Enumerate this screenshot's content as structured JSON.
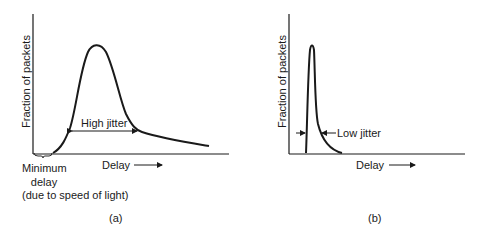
{
  "panels": [
    {
      "id": "a",
      "caption": "(a)",
      "y_axis_label": "Fraction of packets",
      "x_axis_label": "Delay",
      "annotation": "High jitter",
      "min_delay_label": [
        "Minimum",
        "delay",
        "(due to speed of light)"
      ]
    },
    {
      "id": "b",
      "caption": "(b)",
      "y_axis_label": "Fraction of packets",
      "x_axis_label": "Delay",
      "annotation": "Low jitter"
    }
  ],
  "colors": {
    "line": "#1a1a1a",
    "background": "#ffffff"
  }
}
